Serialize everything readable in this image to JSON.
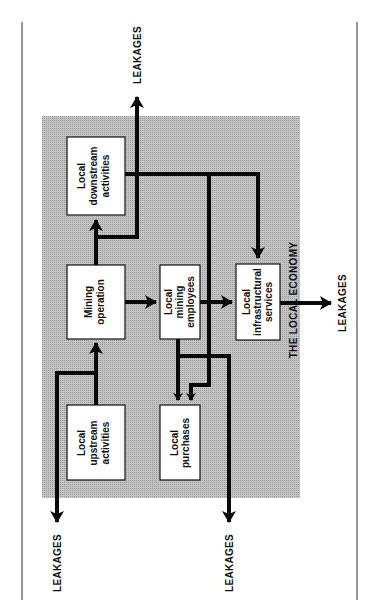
{
  "diagram": {
    "region_label": "THE LOCAL ECONOMY",
    "leakage_label": "LEAKAGES",
    "colors": {
      "region_fill": "#b9b9b9",
      "box_fill": "#ffffff",
      "line": "#0a0a0a"
    },
    "nodes": [
      {
        "id": "downstream",
        "lines": [
          "Local",
          "downstream",
          "activities"
        ]
      },
      {
        "id": "mining",
        "lines": [
          "Mining",
          "operation"
        ]
      },
      {
        "id": "employees",
        "lines": [
          "Local",
          "mining",
          "employees"
        ]
      },
      {
        "id": "infrastructure",
        "lines": [
          "Local",
          "infrastructural",
          "services"
        ]
      },
      {
        "id": "upstream",
        "lines": [
          "Local",
          "upstream",
          "activities"
        ]
      },
      {
        "id": "purchases",
        "lines": [
          "Local",
          "purchases"
        ]
      }
    ],
    "leakages": [
      {
        "id": "leak-top",
        "label": "LEAKAGES"
      },
      {
        "id": "leak-right",
        "label": "LEAKAGES"
      },
      {
        "id": "leak-bottom-left",
        "label": "LEAKAGES"
      },
      {
        "id": "leak-bottom-right",
        "label": "LEAKAGES"
      }
    ],
    "edges": [
      {
        "from": "upstream",
        "to": "mining"
      },
      {
        "from": "mining",
        "to": "downstream"
      },
      {
        "from": "mining",
        "to": "employees"
      },
      {
        "from": "employees",
        "to": "infrastructure"
      },
      {
        "from": "employees",
        "to": "purchases"
      },
      {
        "from": "downstream",
        "to": "infrastructure"
      },
      {
        "from": "downstream",
        "to": "purchases"
      },
      {
        "from": "mining",
        "to": "leak-top"
      },
      {
        "from": "infrastructure",
        "to": "leak-right"
      },
      {
        "from": "upstream",
        "to": "leak-bottom-left"
      },
      {
        "from": "purchases",
        "to": "leak-bottom-right"
      }
    ]
  }
}
